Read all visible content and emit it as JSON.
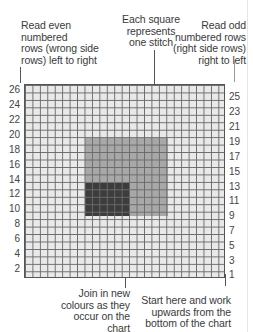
{
  "annotations": {
    "top_left": "Read even numbered rows (wrong side rows) left to right",
    "top_left_lines": [
      "Read even",
      "numbered",
      "rows (wrong side",
      "rows) left to right"
    ],
    "top_center": "Each square represents one stitch",
    "top_center_lines": [
      "Each square",
      "represents",
      "one stitch"
    ],
    "top_right": "Read odd numbered rows (right side rows) right to left",
    "top_right_lines": [
      "Read odd",
      "numbered rows",
      "(right side rows)",
      "right to left"
    ],
    "bottom_center": "Join in new colours as they occur on the chart",
    "bottom_center_lines": [
      "Join in new",
      "colours as they",
      "occur on the",
      "chart"
    ],
    "bottom_right": "Start here and work upwards from the bottom of the chart",
    "bottom_right_lines": [
      "Start here and work",
      "upwards from the",
      "bottom of the chart"
    ]
  },
  "chart": {
    "rows": 26,
    "columns": 27,
    "left_row_labels": [
      "26",
      "24",
      "22",
      "20",
      "18",
      "16",
      "14",
      "12",
      "10",
      "8",
      "6",
      "4",
      "2"
    ],
    "right_row_labels": [
      "25",
      "23",
      "21",
      "19",
      "17",
      "15",
      "13",
      "11",
      "9",
      "7",
      "5",
      "3",
      "1"
    ],
    "colors": {
      "background": "#e9e9e9",
      "grid_line": "#6a6a6a",
      "medium_block": "#a8a8a8",
      "dark_block": "#3c3c3c"
    },
    "blocks": [
      {
        "name": "medium-gray-block",
        "color": "#a8a8a8",
        "col_start": 9,
        "col_end": 19,
        "row_start": 9,
        "row_end": 19
      },
      {
        "name": "dark-gray-block",
        "color": "#3c3c3c",
        "col_start": 9,
        "col_end": 14,
        "row_start": 9,
        "row_end": 12
      }
    ]
  }
}
